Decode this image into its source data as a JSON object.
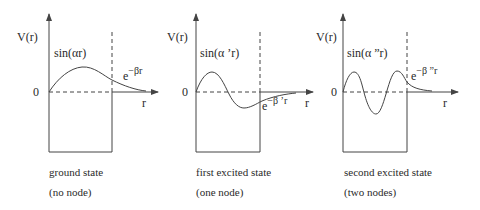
{
  "diagram": {
    "panels": [
      {
        "y_axis_label": "V(r)",
        "origin_label": "0",
        "x_axis_label": "r",
        "inside_function": "sin(αr)",
        "outside_base": "e",
        "outside_exponent": "−βr",
        "caption_line1": "ground state",
        "caption_line2": "(no node)",
        "nodes": 0
      },
      {
        "y_axis_label": "V(r)",
        "origin_label": "0",
        "x_axis_label": "r",
        "inside_function": "sin(α ’r)",
        "outside_base": "e",
        "outside_exponent": "−β ’r",
        "caption_line1": "first excited state",
        "caption_line2": "(one node)",
        "nodes": 1
      },
      {
        "y_axis_label": "V(r)",
        "origin_label": "0",
        "x_axis_label": "r",
        "inside_function": "sin(α ”r)",
        "outside_base": "e",
        "outside_exponent": "−β ”r",
        "caption_line1": "second excited state",
        "caption_line2": "(two nodes)",
        "nodes": 2
      }
    ],
    "colors": {
      "line": "#333333",
      "background": "#ffffff"
    }
  }
}
